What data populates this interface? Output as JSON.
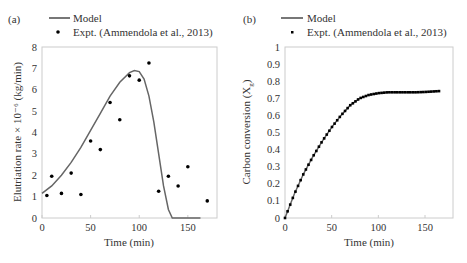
{
  "chart_data": [
    {
      "panel": "(a)",
      "type": "line+scatter",
      "xlabel": "Time (min)",
      "ylabel": "Elutriation rate × 10⁻⁶ (kg/min)",
      "xlim": [
        0,
        180
      ],
      "ylim": [
        0,
        8
      ],
      "xticks": [
        0,
        50,
        100,
        150
      ],
      "yticks": [
        0,
        1,
        2,
        3,
        4,
        5,
        6,
        7,
        8
      ],
      "grid": false,
      "legend": [
        "Model",
        "Expt. (Ammendola et al., 2013)"
      ],
      "series": [
        {
          "name": "Model",
          "kind": "line",
          "x": [
            0,
            10,
            20,
            30,
            40,
            50,
            60,
            70,
            80,
            90,
            95,
            100,
            105,
            110,
            115,
            120,
            125,
            130,
            134,
            140,
            150,
            163
          ],
          "y": [
            1.15,
            1.5,
            2.0,
            2.6,
            3.3,
            4.1,
            4.9,
            5.7,
            6.35,
            6.8,
            6.9,
            6.85,
            6.5,
            5.7,
            4.5,
            3.0,
            1.5,
            0.4,
            0,
            0,
            0,
            0
          ]
        },
        {
          "name": "Expt. (Ammendola et al., 2013)",
          "kind": "scatter",
          "x": [
            5,
            10,
            20,
            30,
            40,
            50,
            60,
            70,
            80,
            90,
            100,
            110,
            120,
            130,
            140,
            150,
            170
          ],
          "y": [
            1.05,
            1.95,
            1.15,
            2.1,
            1.1,
            3.6,
            3.2,
            5.4,
            4.6,
            6.65,
            6.45,
            7.25,
            1.25,
            1.95,
            1.5,
            2.4,
            0.8
          ]
        }
      ]
    },
    {
      "panel": "(b)",
      "type": "line+scatter",
      "xlabel": "Time (min)",
      "ylabel": "Carbon conversion (Xg)",
      "xlim": [
        0,
        180
      ],
      "ylim": [
        0,
        1
      ],
      "xticks": [
        0,
        50,
        100,
        150
      ],
      "yticks": [
        0,
        0.1,
        0.2,
        0.3,
        0.4,
        0.5,
        0.6,
        0.7,
        0.8,
        0.9,
        1
      ],
      "grid": false,
      "legend": [
        "Model",
        "Expt. (Ammendola et al., 2013)"
      ],
      "series": [
        {
          "name": "Model",
          "kind": "line",
          "x": [
            0,
            10,
            20,
            30,
            40,
            50,
            60,
            70,
            80,
            90,
            100,
            110,
            120,
            130,
            140,
            150,
            165
          ],
          "y": [
            0,
            0.14,
            0.26,
            0.36,
            0.45,
            0.53,
            0.6,
            0.66,
            0.7,
            0.72,
            0.73,
            0.735,
            0.735,
            0.735,
            0.735,
            0.737,
            0.742
          ]
        },
        {
          "name": "Expt. (Ammendola et al., 2013)",
          "kind": "scatter",
          "x_range": [
            0,
            165
          ],
          "n_points": 60,
          "y_description": "Dense points overlapping model curve, rising from 0 to ~0.73 by 100 min, plateau ~0.74"
        }
      ]
    }
  ],
  "panels": {
    "a": {
      "label": "(a)",
      "legend_model": "Model",
      "legend_expt": "Expt. (Ammendola et al., 2013)",
      "xlabel": "Time (min)",
      "ylabel": "Elutriation rate × 10⁻⁶ (kg/min)",
      "xticks": [
        "0",
        "50",
        "100",
        "150"
      ],
      "yticks": [
        "0",
        "1",
        "2",
        "3",
        "4",
        "5",
        "6",
        "7",
        "8"
      ]
    },
    "b": {
      "label": "(b)",
      "legend_model": "Model",
      "legend_expt": "Expt. (Ammendola et al., 2013)",
      "xlabel": "Time (min)",
      "ylabel": "Carbon conversion (X",
      "ylabel_sub": "g",
      "ylabel_end": ")",
      "xticks": [
        "0",
        "50",
        "100",
        "150"
      ],
      "yticks": [
        "0",
        "0.1",
        "0.2",
        "0.3",
        "0.4",
        "0.5",
        "0.6",
        "0.7",
        "0.8",
        "0.9",
        "1"
      ]
    }
  }
}
